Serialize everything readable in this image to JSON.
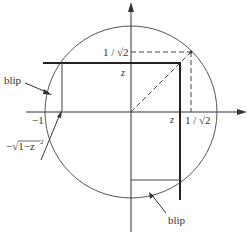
{
  "diagram": {
    "colors": {
      "stroke": "#333333",
      "background": "#ffffff"
    },
    "labels": {
      "inv_sqrt2_y": "1 / √2",
      "inv_sqrt2_x": "1 / √2",
      "z_y": "z",
      "z_x": "z",
      "minus_one": "−1",
      "neg_sqrt": "−√1−z",
      "neg_sqrt_exp": "2",
      "blip_left": "blip",
      "blip_bottom": "blip"
    }
  }
}
